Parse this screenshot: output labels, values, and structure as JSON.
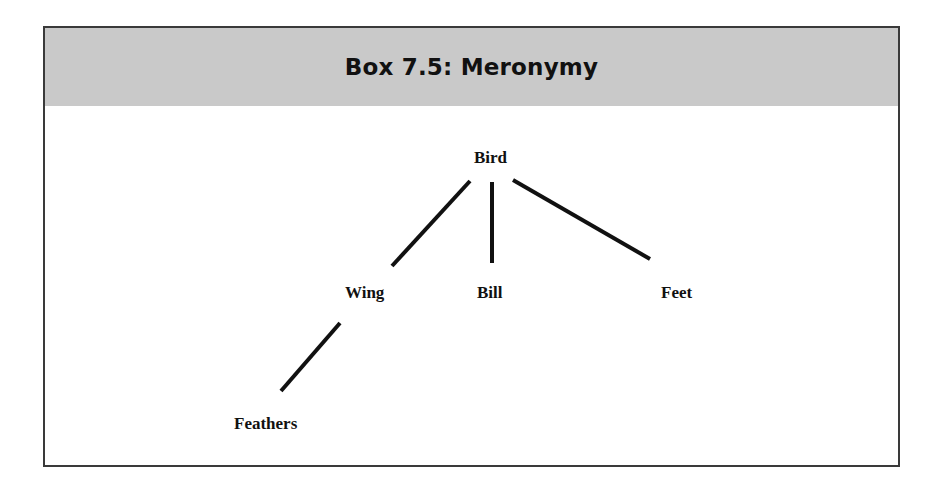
{
  "box": {
    "title": "Box 7.5:  Meronymy",
    "header_color": "#c9c9c9",
    "border_color": "#3a3a3a"
  },
  "diagram": {
    "type": "tree",
    "nodes": [
      {
        "id": "bird",
        "label": "Bird",
        "x": 474,
        "y": 149
      },
      {
        "id": "wing",
        "label": "Wing",
        "x": 345,
        "y": 284
      },
      {
        "id": "bill",
        "label": "Bill",
        "x": 477,
        "y": 284
      },
      {
        "id": "feet",
        "label": "Feet",
        "x": 661,
        "y": 284
      },
      {
        "id": "feathers",
        "label": "Feathers",
        "x": 234,
        "y": 415
      }
    ],
    "edges": [
      {
        "from": "bird",
        "to": "wing",
        "x1": 470,
        "y1": 181,
        "x2": 392,
        "y2": 266
      },
      {
        "from": "bird",
        "to": "bill",
        "x1": 492,
        "y1": 182,
        "x2": 492,
        "y2": 263
      },
      {
        "from": "bird",
        "to": "feet",
        "x1": 513,
        "y1": 180,
        "x2": 650,
        "y2": 259
      },
      {
        "from": "wing",
        "to": "feathers",
        "x1": 340,
        "y1": 323,
        "x2": 281,
        "y2": 391
      }
    ]
  }
}
